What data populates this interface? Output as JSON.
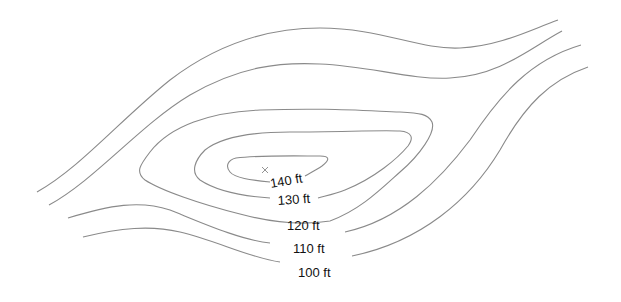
{
  "diagram": {
    "type": "topographic contour map",
    "peak_marker": {
      "symbol": "x",
      "x": 265,
      "y": 170
    },
    "contour_interval_ft": 10,
    "contours": [
      {
        "elevation": 140,
        "label": "140 ft",
        "closed": true
      },
      {
        "elevation": 130,
        "label": "130 ft",
        "closed": true
      },
      {
        "elevation": 120,
        "label": "120 ft",
        "closed": false
      },
      {
        "elevation": 110,
        "label": "110 ft",
        "closed": false
      },
      {
        "elevation": 100,
        "label": "100 ft",
        "closed": false
      }
    ],
    "colors": {
      "line": "#8a8a8a",
      "text": "#111111",
      "background": "#ffffff"
    }
  }
}
